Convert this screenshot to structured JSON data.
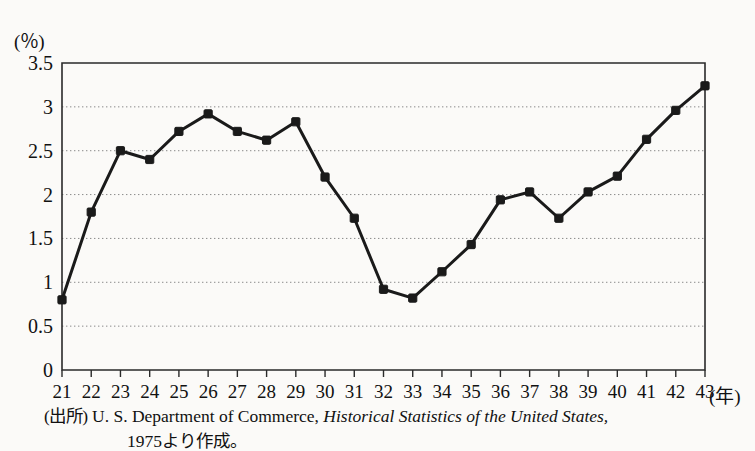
{
  "chart_data": {
    "type": "line",
    "title": "",
    "subtitle": "",
    "xlabel": "(年)",
    "ylabel": "(％)",
    "categories": [
      "21",
      "22",
      "23",
      "24",
      "25",
      "26",
      "27",
      "28",
      "29",
      "30",
      "31",
      "32",
      "33",
      "34",
      "35",
      "36",
      "37",
      "38",
      "39",
      "40",
      "41",
      "42",
      "43"
    ],
    "x": [
      21,
      22,
      23,
      24,
      25,
      26,
      27,
      28,
      29,
      30,
      31,
      32,
      33,
      34,
      35,
      36,
      37,
      38,
      39,
      40,
      41,
      42,
      43
    ],
    "values": [
      0.8,
      1.8,
      2.5,
      2.4,
      2.72,
      2.92,
      2.72,
      2.62,
      2.83,
      2.2,
      1.73,
      0.92,
      0.82,
      1.12,
      1.43,
      1.94,
      2.03,
      1.73,
      2.03,
      2.21,
      2.63,
      2.96,
      3.24
    ],
    "series": [
      {
        "name": "",
        "values": [
          0.8,
          1.8,
          2.5,
          2.4,
          2.72,
          2.92,
          2.72,
          2.62,
          2.83,
          2.2,
          1.73,
          0.92,
          0.82,
          1.12,
          1.43,
          1.94,
          2.03,
          1.73,
          2.03,
          2.21,
          2.63,
          2.96,
          3.24
        ]
      }
    ],
    "ylim": [
      0,
      3.5
    ],
    "xlim": [
      21,
      43
    ],
    "yticks": [
      0,
      0.5,
      1,
      1.5,
      2,
      2.5,
      3,
      3.5
    ],
    "ytick_labels": [
      "0",
      "0.5",
      "1",
      "1.5",
      "2",
      "2.5",
      "3",
      "3.5"
    ],
    "xticks": [
      21,
      22,
      23,
      24,
      25,
      26,
      27,
      28,
      29,
      30,
      31,
      32,
      33,
      34,
      35,
      36,
      37,
      38,
      39,
      40,
      41,
      42,
      43
    ],
    "grid": true,
    "grid_style": "dotted-horizontal",
    "legend": null,
    "legend_position": "none",
    "marker": "filled-square",
    "line_color": "#1a1a1a",
    "grid_color": "#8a8a8a",
    "axis_color": "#2a2a2a",
    "background_color": "#fbfaf8"
  },
  "axes": {
    "y_unit_label": "(％)",
    "x_unit_label": "(年)"
  },
  "caption": {
    "source_label": "(出所)",
    "source_text_1": "U. S. Department of Commerce,",
    "source_title_italic": "Historical Statistics of the United States,",
    "source_text_2": "1975より作成。"
  }
}
